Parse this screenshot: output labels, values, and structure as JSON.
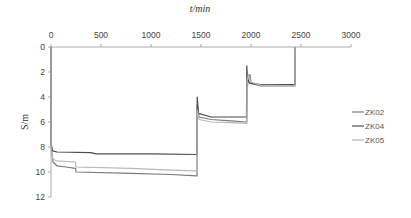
{
  "chart_data": {
    "type": "line",
    "title": "",
    "xlabel": "t/min",
    "ylabel": "S/m",
    "xlim": [
      0,
      3000
    ],
    "ylim": [
      0,
      12
    ],
    "y_inverted": true,
    "x_axis_position": "top",
    "grid": false,
    "legend_position": "right",
    "x_ticks": [
      "0",
      "500",
      "1000",
      "1500",
      "2000",
      "2500",
      "3000"
    ],
    "y_ticks": [
      "0",
      "2",
      "4",
      "6",
      "8",
      "10",
      "12"
    ],
    "series": [
      {
        "name": "ZK02",
        "color": "#7a7a7a",
        "points": [
          [
            0,
            0
          ],
          [
            1,
            7.9
          ],
          [
            20,
            9.2
          ],
          [
            60,
            9.5
          ],
          [
            150,
            9.6
          ],
          [
            245,
            9.7
          ],
          [
            250,
            10.0
          ],
          [
            800,
            10.1
          ],
          [
            1200,
            10.2
          ],
          [
            1455,
            10.3
          ],
          [
            1460,
            10.3
          ],
          [
            1462,
            4.6
          ],
          [
            1480,
            5.6
          ],
          [
            1600,
            5.8
          ],
          [
            1800,
            5.9
          ],
          [
            1955,
            6.0
          ],
          [
            1958,
            6.0
          ],
          [
            1960,
            3.2
          ],
          [
            1990,
            2.2
          ],
          [
            2000,
            2.9
          ],
          [
            2100,
            3.1
          ],
          [
            2440,
            3.1
          ],
          [
            2442,
            0
          ]
        ]
      },
      {
        "name": "ZK04",
        "color": "#4d4d4d",
        "points": [
          [
            0,
            0
          ],
          [
            1,
            7.7
          ],
          [
            15,
            8.3
          ],
          [
            60,
            8.4
          ],
          [
            400,
            8.45
          ],
          [
            450,
            8.55
          ],
          [
            1000,
            8.55
          ],
          [
            1455,
            8.6
          ],
          [
            1460,
            8.6
          ],
          [
            1462,
            4.0
          ],
          [
            1475,
            5.3
          ],
          [
            1600,
            5.6
          ],
          [
            1800,
            5.6
          ],
          [
            1950,
            5.6
          ],
          [
            1955,
            5.6
          ],
          [
            1958,
            1.5
          ],
          [
            1965,
            2.6
          ],
          [
            1990,
            2.9
          ],
          [
            2100,
            3.0
          ],
          [
            2440,
            3.0
          ],
          [
            2442,
            0
          ]
        ]
      },
      {
        "name": "ZK05",
        "color": "#b8b8b8",
        "points": [
          [
            0,
            0
          ],
          [
            1,
            8.2
          ],
          [
            20,
            9.0
          ],
          [
            60,
            9.1
          ],
          [
            245,
            9.2
          ],
          [
            250,
            9.6
          ],
          [
            800,
            9.7
          ],
          [
            1200,
            9.85
          ],
          [
            1455,
            9.9
          ],
          [
            1460,
            9.9
          ],
          [
            1462,
            5.0
          ],
          [
            1480,
            5.8
          ],
          [
            1600,
            6.0
          ],
          [
            1800,
            6.05
          ],
          [
            1955,
            6.1
          ],
          [
            1958,
            6.1
          ],
          [
            1960,
            2.7
          ],
          [
            1975,
            2.2
          ],
          [
            1995,
            2.8
          ],
          [
            2100,
            3.05
          ],
          [
            2440,
            3.1
          ],
          [
            2442,
            0
          ]
        ]
      }
    ]
  }
}
